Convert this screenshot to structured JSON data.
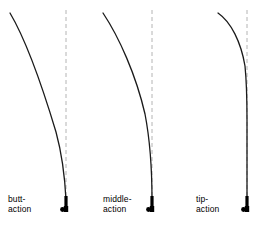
{
  "figure": {
    "width": 266,
    "height": 226,
    "background_color": "#ffffff",
    "rod_color": "#1a1a1a",
    "reference_line_color": "#b4b4b4",
    "handle_color": "#000000"
  },
  "reference_lines": [
    {
      "name": "butt-action-reference",
      "x": 66,
      "y_top": 10,
      "y_bottom": 205,
      "dash": "4,3"
    },
    {
      "name": "middle-action-reference",
      "x": 152,
      "y_top": 10,
      "y_bottom": 205,
      "dash": "4,3"
    },
    {
      "name": "tip-action-reference",
      "x": 247,
      "y_top": 10,
      "y_bottom": 205,
      "dash": "4,3"
    }
  ],
  "rods": [
    {
      "id": "butt-action",
      "label_line1": "butt-",
      "label_line2": "action",
      "label_x": 8,
      "label_y": 194,
      "tip_x": 10,
      "tip_y": 13,
      "base_x": 66,
      "base_y": 200,
      "curve_path": "M 10 13 C 26 40 44 92 56 132 C 62 154 65 180 66 200",
      "handle": {
        "x": 66,
        "y_top": 196,
        "y_bottom": 212,
        "width": 3.2,
        "knob_dx": -3.5,
        "knob_dy": 6
      }
    },
    {
      "id": "middle-action",
      "label_line1": "middle-",
      "label_line2": "action",
      "label_x": 103,
      "label_y": 194,
      "tip_x": 103,
      "tip_y": 13,
      "base_x": 152,
      "base_y": 200,
      "curve_path": "M 103 13 C 119 37 136 75 145 114 C 150 140 152 176 152 200",
      "handle": {
        "x": 152,
        "y_top": 196,
        "y_bottom": 212,
        "width": 3.2,
        "knob_dx": -3.5,
        "knob_dy": 6
      }
    },
    {
      "id": "tip-action",
      "label_line1": "tip-",
      "label_line2": "action",
      "label_x": 196,
      "label_y": 194,
      "tip_x": 218,
      "tip_y": 13,
      "base_x": 247,
      "base_y": 200,
      "curve_path": "M 218 13 C 231 22 241 42 245 66 C 246.6 82 247 100 247 120 L 247 200",
      "handle": {
        "x": 247,
        "y_top": 196,
        "y_bottom": 212,
        "width": 3.2,
        "knob_dx": -3.5,
        "knob_dy": 6
      }
    }
  ]
}
